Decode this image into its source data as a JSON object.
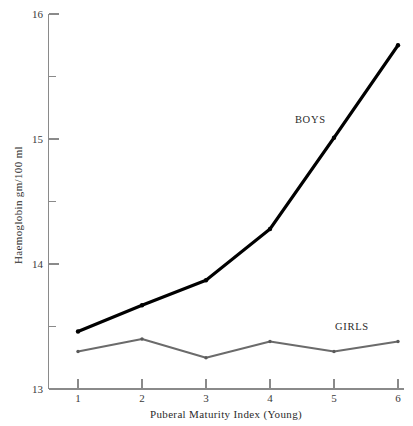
{
  "chart_data": {
    "type": "line",
    "title": "",
    "subtitle": "",
    "xlabel": "Puberal Maturity Index (Young)",
    "ylabel": "Haemoglobin gm/100 ml",
    "x": [
      1,
      2,
      3,
      4,
      5,
      6
    ],
    "xlim": [
      0.6,
      6.25
    ],
    "ylim": [
      13,
      16
    ],
    "grid": false,
    "legend_position": "inline-annotation",
    "x_tick_labels": [
      "1",
      "2",
      "3",
      "4",
      "5",
      "6"
    ],
    "y_tick_labels": [
      "13",
      "14",
      "15",
      "16"
    ],
    "y_ticks_major": [
      13,
      14,
      15,
      16
    ],
    "y_ticks_minor": [
      13.5,
      14.5,
      15.5
    ],
    "series": [
      {
        "name": "BOYS",
        "color": "#000000",
        "values": [
          13.46,
          13.67,
          13.87,
          14.28,
          15.01,
          15.75
        ],
        "label_x": 4.63,
        "label_y": 15.13
      },
      {
        "name": "GIRLS",
        "color": "#6b6b6b",
        "values": [
          13.3,
          13.4,
          13.25,
          13.38,
          13.3,
          13.38
        ],
        "label_x": 5.28,
        "label_y": 13.47
      }
    ]
  },
  "axes": {
    "y_labels": [
      "16",
      "15",
      "14",
      "13"
    ],
    "x_labels": [
      "1",
      "2",
      "3",
      "4",
      "5",
      "6"
    ],
    "x_title": "Puberal Maturity Index (Young)",
    "y_title": "Haemoglobin gm/100 ml"
  },
  "annotations": {
    "boys": "BOYS",
    "girls": "GIRLS"
  }
}
